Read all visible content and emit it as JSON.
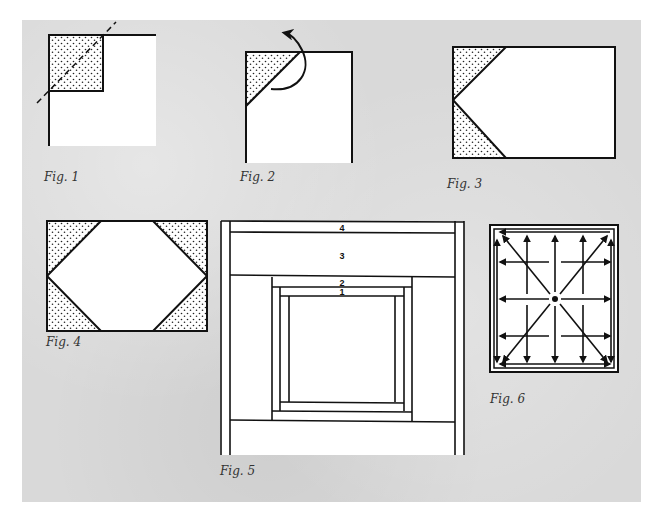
{
  "page": {
    "background_color": "#d9d9d9",
    "line_color": "#111111",
    "fill_color": "#ffffff"
  },
  "figures": [
    {
      "id": "fig1",
      "caption": "Fig. 1",
      "description": "Square with stippled corner square and dashed diagonal fold line"
    },
    {
      "id": "fig2",
      "caption": "Fig. 2",
      "description": "Corner folded into a stippled triangle with curved arrow indicating fold"
    },
    {
      "id": "fig3",
      "caption": "Fig. 3",
      "description": "Rectangle with two stippled triangles on left edge forming a point"
    },
    {
      "id": "fig4",
      "caption": "Fig. 4",
      "description": "Rectangle with four stippled corner triangles forming an elongated hexagon"
    },
    {
      "id": "fig5",
      "caption": "Fig. 5",
      "description": "Log-cabin style strip piecing around central square",
      "strip_labels": [
        "1",
        "2",
        "3",
        "4"
      ]
    },
    {
      "id": "fig6",
      "caption": "Fig. 6",
      "description": "Square with arrows radiating from center indicating pressing/direction"
    }
  ]
}
